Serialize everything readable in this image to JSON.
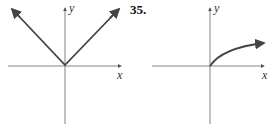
{
  "problem_number": "35.",
  "graphs": [
    {
      "name": "v-shape-graph",
      "x_label": "x",
      "y_label": "y",
      "description": "absolute value V shape with arrows"
    },
    {
      "name": "sqrt-curve-graph",
      "x_label": "x",
      "y_label": "y",
      "description": "increasing concave-down curve from origin with arrow"
    }
  ],
  "colors": {
    "axis": "#555555",
    "curve": "#444444"
  }
}
